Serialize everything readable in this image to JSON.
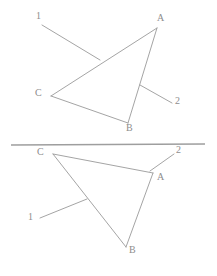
{
  "figure": {
    "background_color": "#ffffff",
    "stroke_color": "#9a9a9a",
    "label_color": "#8d8d8d",
    "divider_color": "#9e9e9e"
  },
  "diagram_data": {
    "type": "diagram",
    "panels": [
      {
        "id": "top-panel",
        "name": "upper-triangle-figure",
        "vertices": [
          {
            "id": "A",
            "label": "A",
            "x": 157,
            "y": 28,
            "label_x": 157,
            "label_y": 13
          },
          {
            "id": "B",
            "label": "B",
            "x": 128,
            "y": 123,
            "label_x": 126,
            "label_y": 123
          },
          {
            "id": "C",
            "label": "C",
            "x": 51,
            "y": 96,
            "label_x": 35,
            "label_y": 88
          }
        ],
        "edges": [
          {
            "from": "A",
            "to": "B"
          },
          {
            "from": "B",
            "to": "C"
          },
          {
            "from": "C",
            "to": "A"
          }
        ],
        "leaders": [
          {
            "label": "1",
            "label_x": 36,
            "label_y": 11,
            "from_x": 42,
            "from_y": 25,
            "to_x": 100,
            "to_y": 60,
            "attaches_to_edge": "C-A"
          },
          {
            "label": "2",
            "label_x": 175,
            "label_y": 96,
            "from_x": 140,
            "from_y": 85,
            "to_x": 172,
            "to_y": 103,
            "attaches_to_edge": "A-B"
          }
        ]
      },
      {
        "id": "bottom-panel",
        "name": "lower-triangle-figure",
        "vertices": [
          {
            "id": "C",
            "label": "C",
            "x": 53,
            "y": 154,
            "label_x": 37,
            "label_y": 147
          },
          {
            "id": "A",
            "label": "A",
            "x": 153,
            "y": 173,
            "label_x": 157,
            "label_y": 172
          },
          {
            "id": "B",
            "label": "B",
            "x": 126,
            "y": 247,
            "label_x": 129,
            "label_y": 245
          }
        ],
        "edges": [
          {
            "from": "C",
            "to": "A"
          },
          {
            "from": "A",
            "to": "B"
          },
          {
            "from": "B",
            "to": "C"
          }
        ],
        "leaders": [
          {
            "label": "1",
            "label_x": 28,
            "label_y": 212,
            "from_x": 40,
            "from_y": 218,
            "to_x": 87,
            "to_y": 199,
            "attaches_to_edge": "C-B"
          },
          {
            "label": "2",
            "label_x": 176,
            "label_y": 145,
            "from_x": 150,
            "from_y": 171,
            "to_x": 174,
            "to_y": 154,
            "attaches_to_edge": "vertex-A"
          }
        ]
      }
    ],
    "divider": {
      "x1": 11,
      "y1": 145,
      "x2": 205,
      "y2": 144
    },
    "labels": [
      "1",
      "2",
      "A",
      "B",
      "C"
    ],
    "annotations": []
  }
}
